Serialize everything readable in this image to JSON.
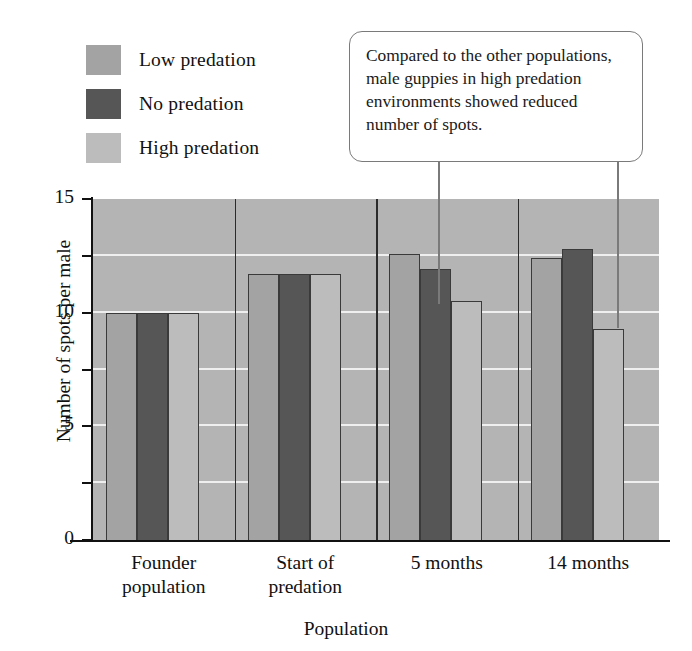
{
  "legend": {
    "items": [
      {
        "label": "Low predation",
        "color": "#a3a3a3",
        "key": "low"
      },
      {
        "label": "No predation",
        "color": "#565656",
        "key": "no"
      },
      {
        "label": "High predation",
        "color": "#bcbcbc",
        "key": "high"
      }
    ]
  },
  "callout": {
    "text": "Compared to the other populations, male guppies in high predation environments showed reduced number of spots."
  },
  "axes": {
    "y_title": "Number of spots per male",
    "x_title": "Population",
    "y_ticks": [
      "0",
      "5",
      "10",
      "15"
    ],
    "y_minor_ticks": [
      "2.5",
      "7.5",
      "12.5"
    ]
  },
  "chart_data": {
    "type": "bar",
    "title": "",
    "xlabel": "Population",
    "ylabel": "Number of spots per male",
    "ylim": [
      0,
      15
    ],
    "y_ticks": [
      0,
      5,
      10,
      15
    ],
    "gridlines": [
      2.5,
      5,
      7.5,
      10,
      12.5,
      15
    ],
    "grid": true,
    "legend_position": "top-left",
    "plot_background": "#b4b4b4",
    "categories": [
      "Founder population",
      "Start of predation",
      "5 months",
      "14 months"
    ],
    "category_lines": [
      [
        "Founder",
        "population"
      ],
      [
        "Start of",
        "predation"
      ],
      [
        "5 months"
      ],
      [
        "14 months"
      ]
    ],
    "series": [
      {
        "name": "Low predation",
        "color": "#a3a3a3",
        "values": [
          10.0,
          11.7,
          12.6,
          12.4
        ]
      },
      {
        "name": "No predation",
        "color": "#565656",
        "values": [
          10.0,
          11.7,
          11.9,
          12.8
        ]
      },
      {
        "name": "High predation",
        "color": "#bcbcbc",
        "values": [
          10.0,
          11.7,
          10.5,
          9.3
        ]
      }
    ],
    "annotations": [
      {
        "text": "Compared to the other populations, male guppies in high predation environments showed reduced number of spots.",
        "points_to": [
          "5 months / High predation",
          "14 months / High predation"
        ]
      }
    ]
  }
}
